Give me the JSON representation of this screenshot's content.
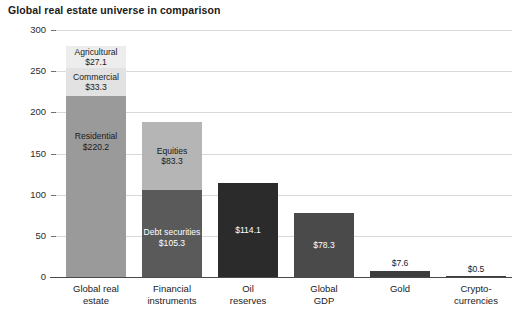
{
  "chart_data": {
    "type": "bar",
    "title": "Global real estate universe in comparison",
    "xlabel": "",
    "ylabel": "USD (trillions)",
    "ylim": [
      0,
      300
    ],
    "yticks": [
      0,
      50,
      100,
      150,
      200,
      250,
      300
    ],
    "ytick_labels": [
      "0",
      "50",
      "100",
      "150",
      "200",
      "250",
      "300"
    ],
    "grid": true,
    "legend": "none",
    "categories": [
      "Global real estate",
      "Financial instruments",
      "Oil reserves",
      "Global GDP",
      "Gold",
      "Cryptocurrencies"
    ],
    "category_lines": [
      [
        "Global real",
        "estate"
      ],
      [
        "Financial",
        "instruments"
      ],
      [
        "Oil",
        "reserves"
      ],
      [
        "Global",
        "GDP"
      ],
      [
        "Gold",
        ""
      ],
      [
        "Crypto-",
        "currencies"
      ]
    ],
    "bars": [
      {
        "category": "Global real estate",
        "total": 280.6,
        "stacked": true,
        "segments": [
          {
            "name": "Residential",
            "value": 220.2,
            "value_label": "$220.2",
            "color": "#9a9a9a",
            "text_color": "#1a1a1a",
            "label_inside": true
          },
          {
            "name": "Commercial",
            "value": 33.3,
            "value_label": "$33.3",
            "color": "#e2e2e2",
            "text_color": "#1a1a1a",
            "label_inside": true
          },
          {
            "name": "Agricultural",
            "value": 27.1,
            "value_label": "$27.1",
            "color": "#ededed",
            "text_color": "#1a1a1a",
            "label_inside": true
          }
        ]
      },
      {
        "category": "Financial instruments",
        "total": 188.6,
        "stacked": true,
        "segments": [
          {
            "name": "Debt securities",
            "value": 105.3,
            "value_label": "$105.3",
            "color": "#5a5a5a",
            "text_color": "#ffffff",
            "label_inside": true
          },
          {
            "name": "Equities",
            "value": 83.3,
            "value_label": "$83.3",
            "color": "#b5b5b5",
            "text_color": "#1a1a1a",
            "label_inside": true
          }
        ]
      },
      {
        "category": "Oil reserves",
        "total": 114.1,
        "stacked": false,
        "segments": [
          {
            "name": "",
            "value": 114.1,
            "value_label": "$114.1",
            "color": "#2b2b2b",
            "text_color": "#ffffff",
            "label_inside": true
          }
        ]
      },
      {
        "category": "Global GDP",
        "total": 78.3,
        "stacked": false,
        "segments": [
          {
            "name": "",
            "value": 78.3,
            "value_label": "$78.3",
            "color": "#4a4a4a",
            "text_color": "#ffffff",
            "label_inside": true
          }
        ]
      },
      {
        "category": "Gold",
        "total": 7.6,
        "stacked": false,
        "segments": [
          {
            "name": "",
            "value": 7.6,
            "value_label": "$7.6",
            "color": "#3d3d3d",
            "text_color": "#1a1a1a",
            "label_inside": false
          }
        ]
      },
      {
        "category": "Cryptocurrencies",
        "total": 0.5,
        "stacked": false,
        "segments": [
          {
            "name": "",
            "value": 0.5,
            "value_label": "$0.5",
            "color": "#3d3d3d",
            "text_color": "#1a1a1a",
            "label_inside": false
          }
        ]
      }
    ],
    "colors": {
      "residential": "#9a9a9a",
      "commercial": "#e2e2e2",
      "agricultural": "#ededed",
      "debt_securities": "#5a5a5a",
      "equities": "#b5b5b5",
      "oil_reserves": "#2b2b2b",
      "global_gdp": "#4a4a4a",
      "gold": "#3d3d3d",
      "crypto": "#3d3d3d",
      "gridline": "#d9d9d9",
      "axis": "#4a4a4a",
      "text": "#1a1a1a",
      "background": "#ffffff"
    }
  }
}
